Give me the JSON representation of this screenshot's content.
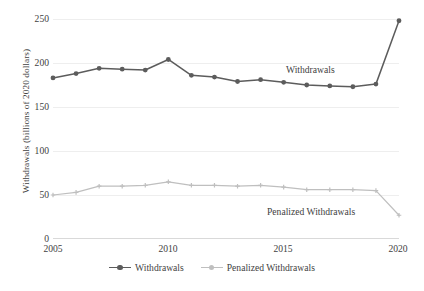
{
  "chart_data": {
    "type": "line",
    "title": "",
    "xlabel": "",
    "ylabel": "Withdrawals (billions of 2020 dollars)",
    "x": [
      2005,
      2006,
      2007,
      2008,
      2009,
      2010,
      2011,
      2012,
      2013,
      2014,
      2015,
      2016,
      2017,
      2018,
      2019,
      2020
    ],
    "xtick_labels": [
      "2005",
      "2010",
      "2015",
      "2020"
    ],
    "xticks": [
      2005,
      2010,
      2015,
      2020
    ],
    "ytick_labels": [
      "0",
      "50",
      "100",
      "150",
      "200",
      "250"
    ],
    "yticks": [
      0,
      50,
      100,
      150,
      200,
      250
    ],
    "ylim": [
      0,
      250
    ],
    "xlim": [
      2005,
      2020
    ],
    "grid": true,
    "legend_position": "bottom",
    "series": [
      {
        "name": "Withdrawals",
        "color": "#5c5c5c",
        "values": [
          183,
          188,
          194,
          193,
          192,
          204,
          186,
          184,
          179,
          181,
          178,
          175,
          174,
          173,
          176,
          248
        ]
      },
      {
        "name": "Penalized Withdrawals",
        "color": "#bfbfbf",
        "values": [
          50,
          53,
          60,
          60,
          61,
          65,
          61,
          61,
          60,
          61,
          59,
          56,
          56,
          56,
          55,
          27
        ]
      }
    ],
    "annotations": [
      {
        "text": "Withdrawals",
        "series": "Withdrawals"
      },
      {
        "text": "Penalized Withdrawals",
        "series": "Penalized Withdrawals"
      }
    ]
  },
  "legend": {
    "items": [
      {
        "label": "Withdrawals",
        "color": "#5c5c5c"
      },
      {
        "label": "Penalized Withdrawals",
        "color": "#bfbfbf"
      }
    ]
  }
}
